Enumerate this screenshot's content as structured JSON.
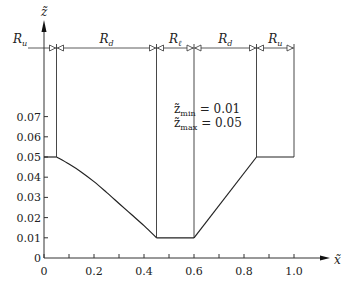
{
  "chart_data": {
    "type": "line",
    "title": "",
    "xlabel": "x̃",
    "ylabel": "z̃",
    "xlim": [
      0,
      1.1
    ],
    "ylim": [
      0,
      0.08
    ],
    "x_ticks": [
      0,
      0.1,
      0.2,
      0.3,
      0.4,
      0.5,
      0.6,
      0.7,
      0.8,
      0.9,
      1.0
    ],
    "x_tick_labels": [
      {
        "value": 0,
        "label": "0"
      },
      {
        "value": 0.2,
        "label": "0.2"
      },
      {
        "value": 0.4,
        "label": "0.4"
      },
      {
        "value": 0.6,
        "label": "0.6"
      },
      {
        "value": 0.8,
        "label": "0.8"
      },
      {
        "value": 1.0,
        "label": "1.0"
      }
    ],
    "y_ticks": [
      {
        "value": 0,
        "label": "0"
      },
      {
        "value": 0.01,
        "label": "0.01"
      },
      {
        "value": 0.02,
        "label": "0.02"
      },
      {
        "value": 0.03,
        "label": "0.03"
      },
      {
        "value": 0.04,
        "label": "0.04"
      },
      {
        "value": 0.05,
        "label": "0.05"
      },
      {
        "value": 0.06,
        "label": "0.06"
      },
      {
        "value": 0.07,
        "label": "0.07"
      }
    ],
    "grid": false,
    "series": [
      {
        "name": "profile",
        "segments": [
          {
            "kind": "flat",
            "x": [
              0.0,
              0.05
            ],
            "y": [
              0.05,
              0.05
            ]
          },
          {
            "kind": "curve",
            "x": [
              0.05,
              0.1,
              0.15,
              0.2,
              0.25,
              0.3,
              0.35,
              0.4,
              0.45
            ],
            "y": [
              0.05,
              0.0465,
              0.0425,
              0.0378,
              0.0325,
              0.027,
              0.0215,
              0.016,
              0.01
            ]
          },
          {
            "kind": "flat",
            "x": [
              0.45,
              0.6
            ],
            "y": [
              0.01,
              0.01
            ]
          },
          {
            "kind": "line",
            "x": [
              0.6,
              0.85
            ],
            "y": [
              0.01,
              0.05
            ]
          },
          {
            "kind": "flat",
            "x": [
              0.85,
              1.0
            ],
            "y": [
              0.05,
              0.05
            ]
          }
        ]
      }
    ],
    "region_boundaries": [
      0,
      0.05,
      0.45,
      0.6,
      0.85,
      1.0
    ],
    "regions": [
      {
        "label": "R_u",
        "main": "R",
        "sub": "u",
        "from": 0,
        "to": 0.05
      },
      {
        "label": "R_d",
        "main": "R",
        "sub": "d",
        "from": 0.05,
        "to": 0.45
      },
      {
        "label": "R_ℓ",
        "main": "R",
        "sub": "ℓ",
        "from": 0.45,
        "to": 0.6
      },
      {
        "label": "R_d",
        "main": "R",
        "sub": "d",
        "from": 0.6,
        "to": 0.85
      },
      {
        "label": "R_u",
        "main": "R",
        "sub": "u",
        "from": 0.85,
        "to": 1.0
      }
    ],
    "annotations": [
      {
        "text": "z̃_min = 0.01",
        "lhs": "z̃",
        "sub": "min",
        "rhs": "= 0.01"
      },
      {
        "text": "z̃_max = 0.05",
        "lhs": "z̃",
        "sub": "max",
        "rhs": "= 0.05"
      }
    ]
  }
}
